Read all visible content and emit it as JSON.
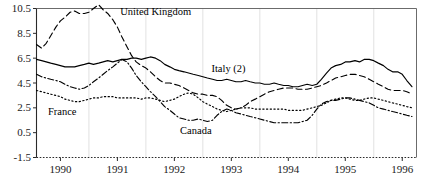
{
  "chart_data": {
    "type": "line",
    "title": "",
    "subtitle": "",
    "xlabel": "",
    "ylabel": "",
    "xlim": [
      1989.58,
      1996.25
    ],
    "ylim": [
      -1.5,
      10.5
    ],
    "yticks": [
      -1.5,
      0.5,
      2.5,
      4.5,
      6.5,
      8.5,
      10.5
    ],
    "ytick_labels": [
      "-1.5",
      "0.5",
      "2.5",
      "4.5",
      "6.5",
      "8.5",
      "10.5"
    ],
    "xticks": [
      1990,
      1991,
      1992,
      1993,
      1994,
      1995,
      1996
    ],
    "xtick_labels": [
      "1990",
      "1991",
      "1992",
      "1993",
      "1994",
      "1995",
      "1996"
    ],
    "gridlines": {
      "vertical": [
        1990.5,
        1991.5,
        1992.5,
        1993.5,
        1994.5,
        1995.5
      ],
      "horizontal": [],
      "grid_on": true,
      "grid_color": "#d9d9d9"
    },
    "legend_position": "inline-annotations",
    "line_color": "#000000",
    "series": [
      {
        "name": "United Kingdom",
        "style": "dashed",
        "label_x": 1991.05,
        "label_y": 10.1,
        "x": [
          1989.58,
          1989.67,
          1989.75,
          1989.83,
          1989.92,
          1990.0,
          1990.08,
          1990.17,
          1990.25,
          1990.33,
          1990.42,
          1990.5,
          1990.58,
          1990.67,
          1990.75,
          1990.83,
          1990.92,
          1991.0,
          1991.08,
          1991.17,
          1991.25,
          1991.33,
          1991.42,
          1991.5,
          1991.58,
          1991.67,
          1991.75,
          1991.83,
          1991.92,
          1992.0,
          1992.08,
          1992.17,
          1992.25,
          1992.33,
          1992.42,
          1992.5,
          1992.58,
          1992.67,
          1992.75,
          1992.83,
          1992.92,
          1993.0,
          1993.08,
          1993.17,
          1993.25,
          1993.33,
          1993.42,
          1993.5,
          1993.58,
          1993.67,
          1993.75,
          1993.83,
          1993.92,
          1994.0,
          1994.08,
          1994.17,
          1994.25,
          1994.33,
          1994.42,
          1994.5,
          1994.58,
          1994.67,
          1994.75,
          1994.83,
          1994.92,
          1995.0,
          1995.08,
          1995.17,
          1995.25,
          1995.33,
          1995.42,
          1995.5,
          1995.58,
          1995.67,
          1995.75,
          1995.83,
          1995.92,
          1996.0,
          1996.08,
          1996.17
        ],
        "y": [
          7.6,
          7.3,
          7.7,
          8.3,
          9.0,
          9.5,
          9.8,
          10.2,
          10.3,
          10.1,
          10.1,
          10.2,
          10.5,
          10.8,
          10.4,
          10.1,
          9.6,
          9.0,
          8.2,
          7.4,
          6.7,
          6.2,
          5.9,
          5.7,
          5.4,
          5.0,
          4.7,
          4.5,
          4.5,
          4.4,
          4.3,
          4.1,
          3.9,
          3.7,
          3.6,
          3.6,
          3.5,
          3.5,
          3.4,
          3.1,
          2.7,
          2.5,
          2.4,
          2.5,
          2.7,
          3.0,
          3.2,
          3.4,
          3.6,
          3.8,
          3.9,
          4.0,
          4.1,
          4.1,
          4.1,
          4.0,
          4.0,
          4.0,
          4.1,
          4.2,
          4.3,
          4.5,
          4.7,
          4.9,
          5.0,
          5.1,
          5.2,
          5.2,
          5.1,
          5.0,
          4.8,
          4.6,
          4.4,
          4.2,
          4.0,
          3.9,
          3.9,
          3.9,
          3.8,
          3.6
        ]
      },
      {
        "name": "Italy (2)",
        "style": "solid",
        "label_x": 1992.65,
        "label_y": 5.55,
        "x": [
          1989.58,
          1989.67,
          1989.75,
          1989.83,
          1989.92,
          1990.0,
          1990.08,
          1990.17,
          1990.25,
          1990.33,
          1990.42,
          1990.5,
          1990.58,
          1990.67,
          1990.75,
          1990.83,
          1990.92,
          1991.0,
          1991.08,
          1991.17,
          1991.25,
          1991.33,
          1991.42,
          1991.5,
          1991.58,
          1991.67,
          1991.75,
          1991.83,
          1991.92,
          1992.0,
          1992.08,
          1992.17,
          1992.25,
          1992.33,
          1992.42,
          1992.5,
          1992.58,
          1992.67,
          1992.75,
          1992.83,
          1992.92,
          1993.0,
          1993.08,
          1993.17,
          1993.25,
          1993.33,
          1993.42,
          1993.5,
          1993.58,
          1993.67,
          1993.75,
          1993.83,
          1993.92,
          1994.0,
          1994.08,
          1994.17,
          1994.25,
          1994.33,
          1994.42,
          1994.5,
          1994.58,
          1994.67,
          1994.75,
          1994.83,
          1994.92,
          1995.0,
          1995.08,
          1995.17,
          1995.25,
          1995.33,
          1995.42,
          1995.5,
          1995.58,
          1995.67,
          1995.75,
          1995.83,
          1995.92,
          1996.0,
          1996.08,
          1996.17
        ],
        "y": [
          6.4,
          6.3,
          6.2,
          6.1,
          6.0,
          5.9,
          5.8,
          5.8,
          5.8,
          5.9,
          6.0,
          6.1,
          6.0,
          6.1,
          6.2,
          6.3,
          6.2,
          6.3,
          6.4,
          6.4,
          6.5,
          6.5,
          6.4,
          6.5,
          6.6,
          6.5,
          6.3,
          6.0,
          5.8,
          5.6,
          5.5,
          5.4,
          5.3,
          5.2,
          5.1,
          5.0,
          4.9,
          4.8,
          4.7,
          4.7,
          4.8,
          4.7,
          4.6,
          4.6,
          4.7,
          4.6,
          4.5,
          4.5,
          4.4,
          4.4,
          4.5,
          4.4,
          4.3,
          4.3,
          4.2,
          4.2,
          4.3,
          4.4,
          4.3,
          4.4,
          4.8,
          5.3,
          5.7,
          5.9,
          6.0,
          6.2,
          6.2,
          6.3,
          6.2,
          6.4,
          6.4,
          6.3,
          6.1,
          5.9,
          5.6,
          5.4,
          5.4,
          5.2,
          4.7,
          4.2
        ]
      },
      {
        "name": "France",
        "style": "dotted",
        "label_x": 1989.78,
        "label_y": 2.05,
        "x": [
          1989.58,
          1989.67,
          1989.75,
          1989.83,
          1989.92,
          1990.0,
          1990.08,
          1990.17,
          1990.25,
          1990.33,
          1990.42,
          1990.5,
          1990.58,
          1990.67,
          1990.75,
          1990.83,
          1990.92,
          1991.0,
          1991.08,
          1991.17,
          1991.25,
          1991.33,
          1991.42,
          1991.5,
          1991.58,
          1991.67,
          1991.75,
          1991.83,
          1991.92,
          1992.0,
          1992.08,
          1992.17,
          1992.25,
          1992.33,
          1992.42,
          1992.5,
          1992.58,
          1992.67,
          1992.75,
          1992.83,
          1992.92,
          1993.0,
          1993.08,
          1993.17,
          1993.25,
          1993.33,
          1993.42,
          1993.5,
          1993.58,
          1993.67,
          1993.75,
          1993.83,
          1993.92,
          1994.0,
          1994.08,
          1994.17,
          1994.25,
          1994.33,
          1994.42,
          1994.5,
          1994.58,
          1994.67,
          1994.75,
          1994.83,
          1994.92,
          1995.0,
          1995.08,
          1995.17,
          1995.25,
          1995.33,
          1995.42,
          1995.5,
          1995.58,
          1995.67,
          1995.75,
          1995.83,
          1995.92,
          1996.0,
          1996.08,
          1996.17
        ],
        "y": [
          3.9,
          3.8,
          3.7,
          3.6,
          3.5,
          3.4,
          3.2,
          3.1,
          3.0,
          3.0,
          3.1,
          3.2,
          3.3,
          3.3,
          3.4,
          3.4,
          3.4,
          3.3,
          3.3,
          3.3,
          3.3,
          3.3,
          3.2,
          3.3,
          3.3,
          3.2,
          3.1,
          3.0,
          3.1,
          3.2,
          3.4,
          3.6,
          3.7,
          3.6,
          3.3,
          3.0,
          2.8,
          2.6,
          2.4,
          2.3,
          2.2,
          2.3,
          2.4,
          2.5,
          2.5,
          2.5,
          2.4,
          2.4,
          2.4,
          2.4,
          2.4,
          2.4,
          2.4,
          2.3,
          2.3,
          2.3,
          2.3,
          2.4,
          2.5,
          2.6,
          2.7,
          2.9,
          3.1,
          3.2,
          3.3,
          3.3,
          3.2,
          3.1,
          3.1,
          3.2,
          3.3,
          3.3,
          3.2,
          3.1,
          3.0,
          2.9,
          2.8,
          2.7,
          2.6,
          2.5
        ]
      },
      {
        "name": "Canada",
        "style": "dashdot",
        "label_x": 1992.1,
        "label_y": 0.55,
        "x": [
          1989.58,
          1989.67,
          1989.75,
          1989.83,
          1989.92,
          1990.0,
          1990.08,
          1990.17,
          1990.25,
          1990.33,
          1990.42,
          1990.5,
          1990.58,
          1990.67,
          1990.75,
          1990.83,
          1990.92,
          1991.0,
          1991.08,
          1991.17,
          1991.25,
          1991.33,
          1991.42,
          1991.5,
          1991.58,
          1991.67,
          1991.75,
          1991.83,
          1991.92,
          1992.0,
          1992.08,
          1992.17,
          1992.25,
          1992.33,
          1992.42,
          1992.5,
          1992.58,
          1992.67,
          1992.75,
          1992.83,
          1992.92,
          1993.0,
          1993.08,
          1993.17,
          1993.25,
          1993.33,
          1993.42,
          1993.5,
          1993.58,
          1993.67,
          1993.75,
          1993.83,
          1993.92,
          1994.0,
          1994.08,
          1994.17,
          1994.25,
          1994.33,
          1994.42,
          1994.5,
          1994.58,
          1994.67,
          1994.75,
          1994.83,
          1994.92,
          1995.0,
          1995.08,
          1995.17,
          1995.25,
          1995.33,
          1995.42,
          1995.5,
          1995.58,
          1995.67,
          1995.75,
          1995.83,
          1995.92,
          1996.0,
          1996.08,
          1996.17
        ],
        "y": [
          5.2,
          5.0,
          4.9,
          4.8,
          4.7,
          4.6,
          4.4,
          4.2,
          4.1,
          4.0,
          4.1,
          4.3,
          4.6,
          4.9,
          5.2,
          5.5,
          5.8,
          6.1,
          6.4,
          6.2,
          5.7,
          5.1,
          4.6,
          4.2,
          3.8,
          3.4,
          3.0,
          2.6,
          2.3,
          2.0,
          1.7,
          1.6,
          1.5,
          1.5,
          1.6,
          1.5,
          1.4,
          1.5,
          1.9,
          2.2,
          2.4,
          2.3,
          2.1,
          2.0,
          1.9,
          1.8,
          1.7,
          1.6,
          1.5,
          1.4,
          1.3,
          1.3,
          1.3,
          1.3,
          1.3,
          1.3,
          1.4,
          1.5,
          1.9,
          2.4,
          2.8,
          3.0,
          3.1,
          3.1,
          3.2,
          3.3,
          3.3,
          3.2,
          3.1,
          3.0,
          2.9,
          2.7,
          2.5,
          2.4,
          2.3,
          2.2,
          2.1,
          2.0,
          1.9,
          1.8
        ]
      }
    ]
  }
}
